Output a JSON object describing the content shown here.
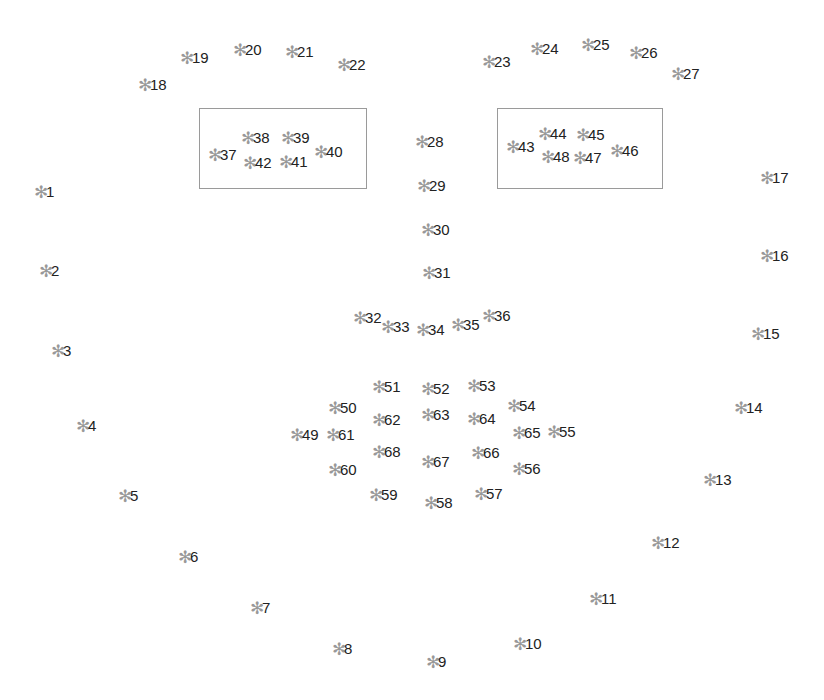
{
  "diagram": {
    "type": "facial-landmarks",
    "marker_glyph": "✻",
    "marker_color": "#999999",
    "label_color": "#222222",
    "box_color": "#9a9a9a",
    "boxes": [
      {
        "name": "left-eye-box",
        "x": 199,
        "y": 108,
        "w": 168,
        "h": 81
      },
      {
        "name": "right-eye-box",
        "x": 497,
        "y": 108,
        "w": 166,
        "h": 81
      }
    ],
    "landmarks": [
      {
        "label": "1",
        "x": 41,
        "y": 192
      },
      {
        "label": "2",
        "x": 46,
        "y": 271
      },
      {
        "label": "3",
        "x": 58,
        "y": 351
      },
      {
        "label": "4",
        "x": 83,
        "y": 426
      },
      {
        "label": "5",
        "x": 125,
        "y": 496
      },
      {
        "label": "6",
        "x": 185,
        "y": 557
      },
      {
        "label": "7",
        "x": 257,
        "y": 608
      },
      {
        "label": "8",
        "x": 339,
        "y": 649
      },
      {
        "label": "9",
        "x": 433,
        "y": 662
      },
      {
        "label": "10",
        "x": 520,
        "y": 644
      },
      {
        "label": "11",
        "x": 596,
        "y": 599
      },
      {
        "label": "12",
        "x": 658,
        "y": 543
      },
      {
        "label": "13",
        "x": 710,
        "y": 480
      },
      {
        "label": "14",
        "x": 741,
        "y": 408
      },
      {
        "label": "15",
        "x": 758,
        "y": 334
      },
      {
        "label": "16",
        "x": 767,
        "y": 256
      },
      {
        "label": "17",
        "x": 767,
        "y": 178
      },
      {
        "label": "18",
        "x": 145,
        "y": 85
      },
      {
        "label": "19",
        "x": 187,
        "y": 58
      },
      {
        "label": "20",
        "x": 240,
        "y": 50
      },
      {
        "label": "21",
        "x": 292,
        "y": 52
      },
      {
        "label": "22",
        "x": 344,
        "y": 65
      },
      {
        "label": "23",
        "x": 489,
        "y": 62
      },
      {
        "label": "24",
        "x": 537,
        "y": 49
      },
      {
        "label": "25",
        "x": 588,
        "y": 45
      },
      {
        "label": "26",
        "x": 636,
        "y": 53
      },
      {
        "label": "27",
        "x": 678,
        "y": 74
      },
      {
        "label": "28",
        "x": 422,
        "y": 142
      },
      {
        "label": "29",
        "x": 424,
        "y": 186
      },
      {
        "label": "30",
        "x": 428,
        "y": 230
      },
      {
        "label": "31",
        "x": 429,
        "y": 273
      },
      {
        "label": "32",
        "x": 360,
        "y": 318
      },
      {
        "label": "33",
        "x": 388,
        "y": 327
      },
      {
        "label": "34",
        "x": 423,
        "y": 330
      },
      {
        "label": "35",
        "x": 458,
        "y": 325
      },
      {
        "label": "36",
        "x": 489,
        "y": 316
      },
      {
        "label": "37",
        "x": 215,
        "y": 155
      },
      {
        "label": "38",
        "x": 248,
        "y": 138
      },
      {
        "label": "39",
        "x": 288,
        "y": 138
      },
      {
        "label": "40",
        "x": 321,
        "y": 152
      },
      {
        "label": "41",
        "x": 286,
        "y": 162
      },
      {
        "label": "42",
        "x": 250,
        "y": 163
      },
      {
        "label": "43",
        "x": 513,
        "y": 147
      },
      {
        "label": "44",
        "x": 545,
        "y": 134
      },
      {
        "label": "45",
        "x": 583,
        "y": 135
      },
      {
        "label": "46",
        "x": 617,
        "y": 151
      },
      {
        "label": "47",
        "x": 580,
        "y": 158
      },
      {
        "label": "48",
        "x": 548,
        "y": 157
      },
      {
        "label": "49",
        "x": 297,
        "y": 435
      },
      {
        "label": "50",
        "x": 335,
        "y": 408
      },
      {
        "label": "51",
        "x": 379,
        "y": 387
      },
      {
        "label": "52",
        "x": 428,
        "y": 389
      },
      {
        "label": "53",
        "x": 474,
        "y": 386
      },
      {
        "label": "54",
        "x": 514,
        "y": 406
      },
      {
        "label": "55",
        "x": 554,
        "y": 432
      },
      {
        "label": "56",
        "x": 519,
        "y": 469
      },
      {
        "label": "57",
        "x": 481,
        "y": 494
      },
      {
        "label": "58",
        "x": 431,
        "y": 503
      },
      {
        "label": "59",
        "x": 376,
        "y": 495
      },
      {
        "label": "60",
        "x": 335,
        "y": 470
      },
      {
        "label": "61",
        "x": 333,
        "y": 435
      },
      {
        "label": "62",
        "x": 379,
        "y": 420
      },
      {
        "label": "63",
        "x": 428,
        "y": 415
      },
      {
        "label": "64",
        "x": 474,
        "y": 419
      },
      {
        "label": "65",
        "x": 519,
        "y": 433
      },
      {
        "label": "66",
        "x": 478,
        "y": 453
      },
      {
        "label": "67",
        "x": 428,
        "y": 462
      },
      {
        "label": "68",
        "x": 379,
        "y": 452
      }
    ]
  }
}
